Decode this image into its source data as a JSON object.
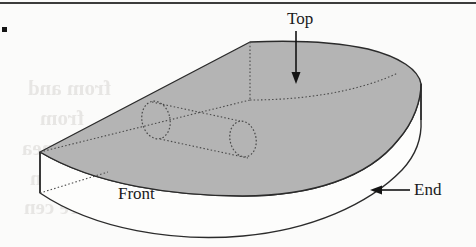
{
  "figure": {
    "type": "technical-illustration",
    "page_rule_color": "#3c3c3c",
    "bullet_marker": "▪",
    "top_face_fill": "#b4b4b4",
    "front_face_fill": "#fdfdfc",
    "outline_color": "#2b2b2b",
    "hidden_line_color": "#4a4a4a",
    "labels": [
      {
        "id": "top",
        "text": "Top",
        "x": 287,
        "y": 10,
        "size": 17
      },
      {
        "id": "front",
        "text": "Front",
        "x": 118,
        "y": 186,
        "size": 17
      },
      {
        "id": "end",
        "text": "End",
        "x": 414,
        "y": 181,
        "size": 17
      }
    ],
    "leaders": [
      {
        "id": "top-arrow",
        "from": [
          296,
          30
        ],
        "to": [
          296,
          80
        ],
        "direction": "down"
      },
      {
        "id": "end-arrow",
        "from": [
          412,
          190
        ],
        "to": [
          378,
          190
        ],
        "direction": "left"
      }
    ],
    "geometry": {
      "apex": [
        250,
        42
      ],
      "left_corner": [
        40,
        152
      ],
      "bottom_left": [
        40,
        193
      ],
      "right_extent": [
        417,
        112
      ],
      "top_face_points": "250,42 40,152 236,196 345,185 398,152 417,112 410,82 382,62 330,48",
      "bore_left_ellipse": {
        "cx": 156,
        "cy": 120,
        "rx": 14,
        "ry": 19,
        "rot": -12
      },
      "bore_right_ellipse": {
        "cx": 243,
        "cy": 139,
        "rx": 13,
        "ry": 18,
        "rot": -12
      }
    }
  },
  "ghost_text": {
    "note": "faint show-through text from reverse of printed page (mirrored)",
    "lines": [
      {
        "text": "from and",
        "x": 28,
        "y": 88,
        "size": 21
      },
      {
        "text": "from",
        "x": 40,
        "y": 118,
        "size": 21
      },
      {
        "text": "n the surface are nea",
        "x": 22,
        "y": 148,
        "size": 21
      },
      {
        "text": "nswer cannot (  ) sin",
        "x": 30,
        "y": 178,
        "size": 21
      },
      {
        "text": "semicircles-but they are cen",
        "x": 24,
        "y": 207,
        "size": 21
      }
    ]
  }
}
